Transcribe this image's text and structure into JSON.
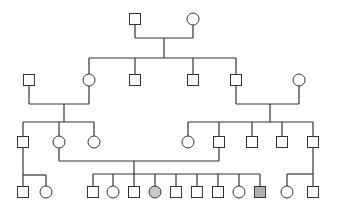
{
  "diagram": {
    "type": "pedigree",
    "colors": {
      "line": "#333333",
      "unaffected": "#ffffff",
      "affected_female": "#c8c8c8",
      "affected_male": "#b0b0b0"
    },
    "size": 11,
    "individuals": [
      {
        "id": "I1",
        "sex": "male",
        "x": 135,
        "y": 19,
        "affected": false
      },
      {
        "id": "I2",
        "sex": "female",
        "x": 193,
        "y": 19,
        "affected": false
      },
      {
        "id": "II1",
        "sex": "male",
        "x": 29,
        "y": 80,
        "affected": false
      },
      {
        "id": "II2",
        "sex": "female",
        "x": 89,
        "y": 80,
        "affected": false
      },
      {
        "id": "II3",
        "sex": "male",
        "x": 135,
        "y": 80,
        "affected": false
      },
      {
        "id": "II4",
        "sex": "male",
        "x": 193,
        "y": 80,
        "affected": false
      },
      {
        "id": "II5",
        "sex": "male",
        "x": 236,
        "y": 80,
        "affected": false
      },
      {
        "id": "II6",
        "sex": "female",
        "x": 299,
        "y": 80,
        "affected": false
      },
      {
        "id": "III1",
        "sex": "male",
        "x": 23,
        "y": 142,
        "affected": false
      },
      {
        "id": "III2",
        "sex": "female",
        "x": 59,
        "y": 142,
        "affected": false
      },
      {
        "id": "III3",
        "sex": "female",
        "x": 94,
        "y": 142,
        "affected": false
      },
      {
        "id": "III4",
        "sex": "female",
        "x": 188,
        "y": 142,
        "affected": false
      },
      {
        "id": "III5",
        "sex": "male",
        "x": 219,
        "y": 142,
        "affected": false
      },
      {
        "id": "III6",
        "sex": "male",
        "x": 252,
        "y": 142,
        "affected": false
      },
      {
        "id": "III7",
        "sex": "male",
        "x": 282,
        "y": 142,
        "affected": false
      },
      {
        "id": "III8",
        "sex": "male",
        "x": 313,
        "y": 142,
        "affected": false
      },
      {
        "id": "IV1",
        "sex": "male",
        "x": 23,
        "y": 192,
        "affected": false
      },
      {
        "id": "IV2",
        "sex": "female",
        "x": 46,
        "y": 192,
        "affected": false
      },
      {
        "id": "IV3",
        "sex": "male",
        "x": 93,
        "y": 192,
        "affected": false
      },
      {
        "id": "IV4",
        "sex": "female",
        "x": 113,
        "y": 192,
        "affected": false
      },
      {
        "id": "IV5",
        "sex": "male",
        "x": 134,
        "y": 192,
        "affected": false
      },
      {
        "id": "IV6",
        "sex": "female",
        "x": 155,
        "y": 192,
        "affected": true
      },
      {
        "id": "IV7",
        "sex": "male",
        "x": 176,
        "y": 192,
        "affected": false
      },
      {
        "id": "IV8",
        "sex": "male",
        "x": 197,
        "y": 192,
        "affected": false
      },
      {
        "id": "IV9",
        "sex": "male",
        "x": 218,
        "y": 192,
        "affected": false
      },
      {
        "id": "IV10",
        "sex": "female",
        "x": 239,
        "y": 192,
        "affected": false
      },
      {
        "id": "IV11",
        "sex": "male",
        "x": 260,
        "y": 192,
        "affected": true
      },
      {
        "id": "IV12",
        "sex": "female",
        "x": 287,
        "y": 192,
        "affected": false
      },
      {
        "id": "IV13",
        "sex": "male",
        "x": 313,
        "y": 192,
        "affected": false
      }
    ],
    "lines": [
      [
        135,
        25,
        135,
        38
      ],
      [
        193,
        25,
        193,
        38
      ],
      [
        135,
        38,
        193,
        38
      ],
      [
        164,
        38,
        164,
        58
      ],
      [
        89,
        58,
        236,
        58
      ],
      [
        89,
        58,
        89,
        74
      ],
      [
        135,
        58,
        135,
        74
      ],
      [
        193,
        58,
        193,
        74
      ],
      [
        236,
        58,
        236,
        74
      ],
      [
        29,
        86,
        29,
        104
      ],
      [
        89,
        86,
        89,
        104
      ],
      [
        29,
        104,
        89,
        104
      ],
      [
        64,
        104,
        64,
        122
      ],
      [
        23,
        122,
        94,
        122
      ],
      [
        23,
        122,
        23,
        136
      ],
      [
        59,
        122,
        59,
        136
      ],
      [
        94,
        122,
        94,
        136
      ],
      [
        236,
        86,
        236,
        104
      ],
      [
        299,
        86,
        299,
        104
      ],
      [
        236,
        104,
        299,
        104
      ],
      [
        270,
        104,
        270,
        122
      ],
      [
        188,
        122,
        313,
        122
      ],
      [
        188,
        122,
        188,
        136
      ],
      [
        219,
        122,
        219,
        136
      ],
      [
        252,
        122,
        252,
        136
      ],
      [
        282,
        122,
        282,
        136
      ],
      [
        313,
        122,
        313,
        136
      ],
      [
        59,
        148,
        59,
        161
      ],
      [
        219,
        148,
        219,
        161
      ],
      [
        59,
        161,
        219,
        161
      ],
      [
        134,
        161,
        134,
        174
      ],
      [
        93,
        174,
        260,
        174
      ],
      [
        93,
        174,
        93,
        186
      ],
      [
        113,
        174,
        113,
        186
      ],
      [
        134,
        174,
        134,
        186
      ],
      [
        155,
        174,
        155,
        186
      ],
      [
        176,
        174,
        176,
        186
      ],
      [
        197,
        174,
        197,
        186
      ],
      [
        218,
        174,
        218,
        186
      ],
      [
        239,
        174,
        239,
        186
      ],
      [
        260,
        174,
        260,
        186
      ],
      [
        23,
        148,
        23,
        186
      ],
      [
        23,
        175,
        46,
        175
      ],
      [
        46,
        175,
        46,
        186
      ],
      [
        313,
        148,
        313,
        186
      ],
      [
        287,
        174,
        313,
        174
      ],
      [
        287,
        174,
        287,
        186
      ]
    ]
  }
}
